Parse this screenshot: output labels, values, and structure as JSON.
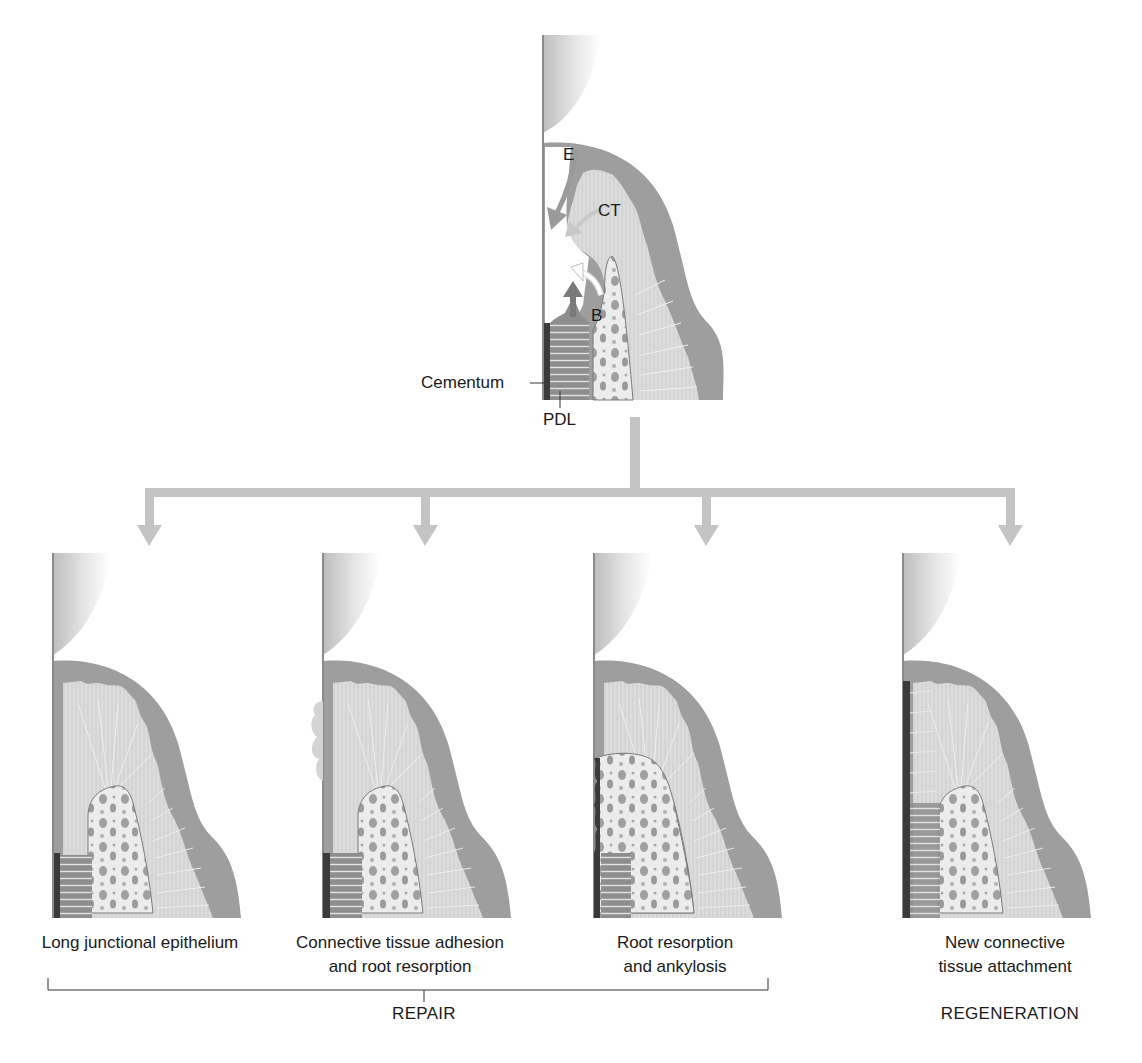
{
  "figure": {
    "top_diagram": {
      "labels": {
        "epithelium": "E",
        "connective_tissue": "CT",
        "bone": "B",
        "cementum": "Cementum",
        "pdl": "PDL"
      }
    },
    "outcomes": [
      {
        "caption_line1": "Long junctional epithelium",
        "caption_line2": ""
      },
      {
        "caption_line1": "Connective tissue adhesion",
        "caption_line2": "and root resorption"
      },
      {
        "caption_line1": "Root resorption",
        "caption_line2": "and ankylosis"
      },
      {
        "caption_line1": "New connective",
        "caption_line2": "tissue attachment"
      }
    ],
    "groups": {
      "repair": "REPAIR",
      "regeneration": "REGENERATION"
    },
    "colors": {
      "epithelium": "#9a9a9a",
      "connective_tissue": "#d6d6d6",
      "bone": "#ececec",
      "bone_marrow": "#9c9c9c",
      "cementum": "#3a3a3a",
      "pdl": "#8c8c8c",
      "arrow_flow": "#c4c4c4",
      "arrow_dark": "#7a7a7a"
    }
  }
}
